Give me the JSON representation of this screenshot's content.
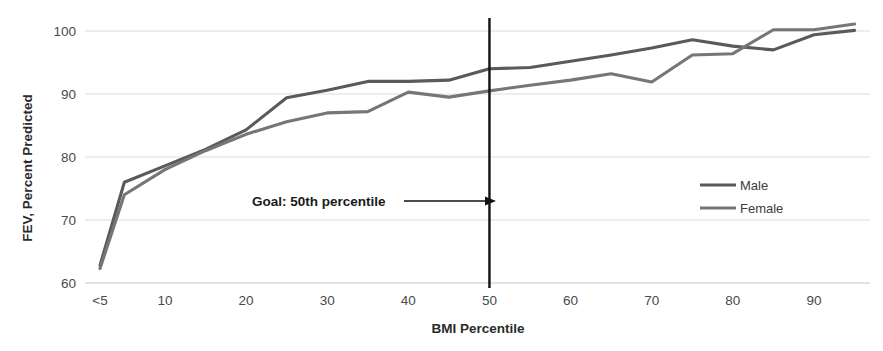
{
  "chart_data": {
    "type": "line",
    "title": "",
    "xlabel": "BMI Percentile",
    "ylabel": "FEV, Percent Predicted",
    "xlim": [
      0,
      100
    ],
    "ylim": [
      60,
      102
    ],
    "grid": true,
    "legend_position": "right",
    "ytick_labels": [
      "100",
      "90",
      "80",
      "70",
      "60"
    ],
    "yticks": [
      100,
      90,
      80,
      70,
      60
    ],
    "xtick_labels": [
      "<5",
      "10",
      "20",
      "30",
      "40",
      "50",
      "60",
      "70",
      "80",
      "90"
    ],
    "xticks": [
      2,
      10,
      20,
      30,
      40,
      50,
      60,
      70,
      80,
      90
    ],
    "series": [
      {
        "name": "Male",
        "color": "#5a5a5a",
        "x": [
          2,
          5,
          10,
          15,
          20,
          25,
          30,
          35,
          40,
          45,
          50,
          55,
          60,
          65,
          70,
          75,
          80,
          85,
          90,
          95
        ],
        "values": [
          62.8,
          76.0,
          78.6,
          81.2,
          84.3,
          89.4,
          90.6,
          92.0,
          92.0,
          92.2,
          94.0,
          94.2,
          95.2,
          96.2,
          97.3,
          98.6,
          97.6,
          97.0,
          99.4,
          100.1
        ]
      },
      {
        "name": "Female",
        "color": "#767676",
        "x": [
          2,
          5,
          10,
          15,
          20,
          25,
          30,
          35,
          40,
          45,
          50,
          55,
          60,
          65,
          70,
          75,
          80,
          85,
          90,
          95
        ],
        "values": [
          62.3,
          74.0,
          78.0,
          81.0,
          83.6,
          85.6,
          87.0,
          87.2,
          90.3,
          89.5,
          90.5,
          91.4,
          92.2,
          93.2,
          91.9,
          96.2,
          96.4,
          100.2,
          100.2,
          101.1
        ]
      }
    ],
    "annotations": [
      {
        "name": "goal-annotation",
        "text": "Goal: 50th percentile",
        "arrow_to_x": 50,
        "reference_line_x": 50,
        "reference_line_color": "#111111"
      }
    ]
  },
  "legend": {
    "items": [
      {
        "label": "Male",
        "color": "#5a5a5a"
      },
      {
        "label": "Female",
        "color": "#767676"
      }
    ]
  },
  "axes": {
    "y_title": "FEV, Percent Predicted",
    "x_title": "BMI Percentile"
  }
}
